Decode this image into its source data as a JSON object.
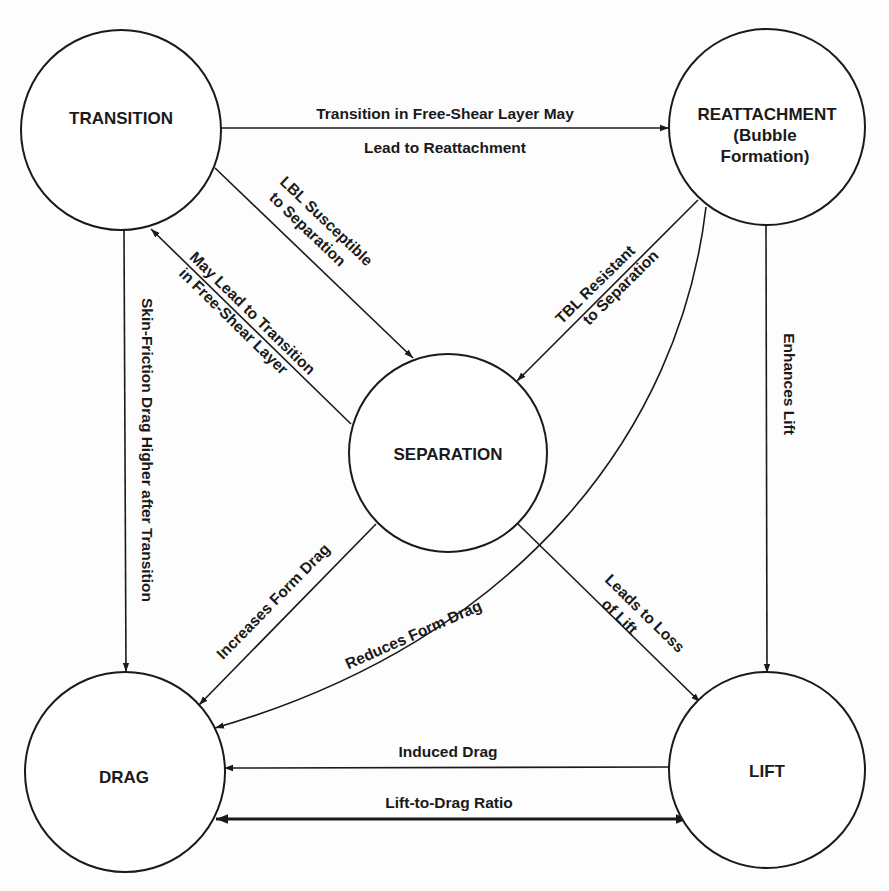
{
  "nodes": {
    "transition": {
      "label": "TRANSITION"
    },
    "reattachment": {
      "label_line1": "REATTACHMENT",
      "label_line2": "(Bubble",
      "label_line3": "Formation)"
    },
    "separation": {
      "label": "SEPARATION"
    },
    "drag": {
      "label": "DRAG"
    },
    "lift": {
      "label": "LIFT"
    }
  },
  "edges": {
    "transition_to_reattachment": {
      "line1": "Transition in Free-Shear Layer May",
      "line2": "Lead to Reattachment"
    },
    "transition_to_separation": {
      "line1": "LBL Susceptible",
      "line2": "to Separation"
    },
    "separation_to_transition": {
      "line1": "May Lead to Transition",
      "line2": "in Free-Shear Layer"
    },
    "transition_to_drag": {
      "label": "Skin-Friction Drag Higher after Transition"
    },
    "reattachment_to_separation": {
      "line1": "TBL Resistant",
      "line2": "to Separation"
    },
    "reattachment_to_drag": {
      "label": "Reduces Form Drag"
    },
    "reattachment_to_lift": {
      "label": "Enhances Lift"
    },
    "separation_to_drag": {
      "label": "Increases Form Drag"
    },
    "separation_to_lift": {
      "line1": "Leads to Loss",
      "line2": "of Lift"
    },
    "lift_to_drag": {
      "label": "Induced Drag"
    },
    "lift_drag_ratio": {
      "label": "Lift-to-Drag Ratio"
    }
  },
  "colors": {
    "ink": "#1a1a1a",
    "background": "#ffffff"
  }
}
